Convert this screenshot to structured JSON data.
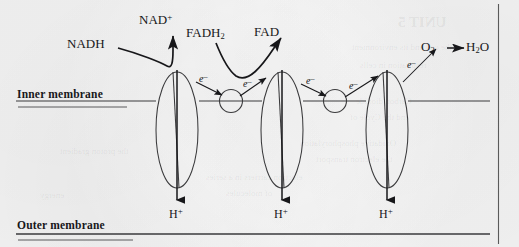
{
  "figure": {
    "type": "biology-diagram",
    "background_color": "#f1f1f1",
    "ink_color": "#17171a"
  },
  "membranes": {
    "inner_label": "Inner membrane",
    "outer_label": "Outer membrane"
  },
  "molecules": {
    "nadh": "NADH",
    "nad_plus_base": "NAD",
    "nad_plus_sup": "+",
    "fadh2_base": "FADH",
    "fadh2_sub": "2",
    "fad": "FAD",
    "o2_base": "O",
    "o2_sub": "2",
    "arrow": "→",
    "h2o_h": "H",
    "h2o_sub": "2",
    "h2o_o": "O"
  },
  "electrons": {
    "e1": "e",
    "e2": "e",
    "e3": "e",
    "e4": "e",
    "e5": "e",
    "charge": "–"
  },
  "protons": {
    "h_symbol": "H",
    "charge": "+",
    "labels": [
      "H+",
      "H+",
      "H+"
    ]
  },
  "bleed_through": [
    {
      "text": "UNIT 5",
      "x": 398,
      "y": 14,
      "size": 15,
      "weight": "bold"
    },
    {
      "text": "the cell and its environment",
      "x": 352,
      "y": 42,
      "size": 9,
      "weight": "normal"
    },
    {
      "text": "respiration in cells",
      "x": 360,
      "y": 60,
      "size": 9,
      "weight": "normal"
    },
    {
      "text": "Carbon  dioxide",
      "x": 356,
      "y": 96,
      "size": 9,
      "weight": "normal"
    },
    {
      "text": "and the Cycle of",
      "x": 350,
      "y": 112,
      "size": 9,
      "weight": "normal"
    },
    {
      "text": "Oxidative phosphorylation",
      "x": 300,
      "y": 138,
      "size": 9,
      "weight": "normal"
    },
    {
      "text": "the electron transport",
      "x": 316,
      "y": 154,
      "size": 9,
      "weight": "normal"
    },
    {
      "text": "electron carriers in a series",
      "x": 206,
      "y": 172,
      "size": 9,
      "weight": "normal"
    },
    {
      "text": "of molecules",
      "x": 226,
      "y": 188,
      "size": 9,
      "weight": "normal"
    },
    {
      "text": "the proton gradient",
      "x": 60,
      "y": 146,
      "size": 9,
      "weight": "normal"
    },
    {
      "text": "energy",
      "x": 40,
      "y": 190,
      "size": 9,
      "weight": "normal"
    }
  ]
}
